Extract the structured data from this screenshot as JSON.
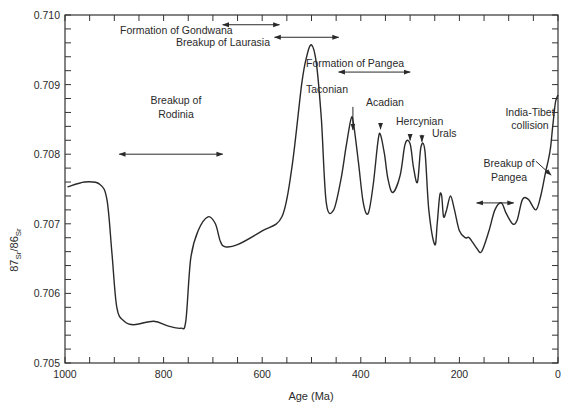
{
  "chart_data": {
    "type": "line",
    "title": "",
    "xlabel": "Age (Ma)",
    "ylabel_parts": {
      "sup1": "87",
      "sub1": "Sr",
      "slash": "/",
      "sup2": "86",
      "sub2": "Sr"
    },
    "xlim": [
      1000,
      0
    ],
    "ylim": [
      0.705,
      0.71
    ],
    "x_ticks": [
      1000,
      800,
      600,
      400,
      200,
      0
    ],
    "x_tick_labels": [
      "1000",
      "800",
      "600",
      "400",
      "200",
      "0"
    ],
    "x_minor_step": 50,
    "y_ticks": [
      0.705,
      0.706,
      0.707,
      0.708,
      0.709,
      0.71
    ],
    "y_tick_labels": [
      "0.705",
      "0.706",
      "0.707",
      "0.708",
      "0.709",
      "0.710"
    ],
    "y_minor_step": 0.0002,
    "grid": false,
    "series": [
      {
        "name": "87Sr/86Sr seawater curve",
        "x": [
          995,
          960,
          930,
          915,
          905,
          895,
          880,
          860,
          820,
          790,
          765,
          755,
          745,
          730,
          710,
          695,
          685,
          675,
          650,
          600,
          560,
          540,
          520,
          510,
          500,
          490,
          480,
          470,
          455,
          440,
          430,
          420,
          415,
          405,
          395,
          385,
          375,
          365,
          360,
          352,
          345,
          335,
          320,
          310,
          300,
          293,
          285,
          278,
          270,
          262,
          250,
          245,
          240,
          236,
          232,
          226,
          218,
          210,
          200,
          188,
          180,
          165,
          155,
          140,
          128,
          115,
          105,
          92,
          83,
          72,
          60,
          45,
          35,
          25,
          20,
          15,
          10,
          5,
          0
        ],
        "y": [
          0.70753,
          0.7076,
          0.70757,
          0.70735,
          0.7066,
          0.7058,
          0.7056,
          0.70555,
          0.7056,
          0.70553,
          0.7055,
          0.7056,
          0.7065,
          0.7069,
          0.7071,
          0.707,
          0.70675,
          0.70667,
          0.7067,
          0.7069,
          0.7071,
          0.7078,
          0.709,
          0.7094,
          0.70957,
          0.7093,
          0.7085,
          0.7073,
          0.7072,
          0.70765,
          0.7081,
          0.7085,
          0.70845,
          0.7079,
          0.7073,
          0.70715,
          0.70755,
          0.7082,
          0.70828,
          0.708,
          0.70765,
          0.70745,
          0.7077,
          0.70815,
          0.70815,
          0.7078,
          0.7076,
          0.7081,
          0.70805,
          0.7072,
          0.7067,
          0.707,
          0.7074,
          0.7074,
          0.7071,
          0.7072,
          0.7074,
          0.7072,
          0.7069,
          0.7068,
          0.7068,
          0.70665,
          0.7066,
          0.7069,
          0.7072,
          0.7073,
          0.70715,
          0.707,
          0.70705,
          0.70735,
          0.70735,
          0.7072,
          0.7074,
          0.70775,
          0.7079,
          0.7081,
          0.70845,
          0.70875,
          0.70885
        ]
      }
    ],
    "annotations": [
      {
        "label": "Formation of Gondwana",
        "type": "range",
        "x_from": 680,
        "x_to": 565,
        "y": 0.70986,
        "text_x": 880,
        "text_y": 0.7099
      },
      {
        "label": "Breakup of Laurasia",
        "type": "range",
        "x_from": 575,
        "x_to": 445,
        "y": 0.70968,
        "text_x": 735,
        "text_y": 0.70972
      },
      {
        "label": "Formation of Pangea",
        "type": "range",
        "x_from": 445,
        "x_to": 300,
        "y": 0.70918,
        "text_x": 445,
        "text_y": 0.70935
      },
      {
        "label": "Taconian",
        "type": "arrow",
        "x_arrow": 416,
        "y_from": 0.70835,
        "y_to": 0.70868,
        "text_x": 445,
        "text_y": 0.7088
      },
      {
        "label": "Acadian",
        "type": "arrow",
        "x_arrow": 360,
        "y_from": 0.70836,
        "y_to": 0.70845,
        "text_x": 380,
        "text_y": 0.70858
      },
      {
        "label": "Hercynian",
        "type": "arrow",
        "x_arrow": 300,
        "y_from": 0.7082,
        "y_to": 0.70828,
        "text_x": 318,
        "text_y": 0.70835
      },
      {
        "label": "Urals",
        "type": "arrow",
        "x_arrow": 276,
        "y_from": 0.70818,
        "y_to": 0.70828,
        "text_x": 260,
        "text_y": 0.70818
      },
      {
        "label": "Breakup of Rodinia",
        "type": "range",
        "x_from": 890,
        "x_to": 680,
        "y": 0.708,
        "text_x": 790,
        "text_y": 0.70852,
        "lines": [
          "Breakup of",
          "Rodinia"
        ]
      },
      {
        "label": "Breakup of Pangea",
        "type": "range",
        "x_from": 165,
        "x_to": 90,
        "y": 0.7073,
        "text_x": 128,
        "text_y": 0.70752,
        "lines": [
          "Breakup of",
          "Pangea"
        ]
      },
      {
        "label": "India-Tibet collision",
        "type": "arrow",
        "x_from": 45,
        "y_from": 0.7079,
        "x_to": 14,
        "y_to": 0.7077,
        "text_x": 45,
        "text_y": 0.7082,
        "lines": [
          "India-Tibet",
          "collision"
        ]
      }
    ]
  },
  "labels": {
    "annotation_gondwana": "Formation of Gondwana",
    "annotation_laurasia": "Breakup of Laurasia",
    "annotation_pangea_formation": "Formation of Pangea",
    "annotation_taconian": "Taconian",
    "annotation_acadian": "Acadian",
    "annotation_hercynian": "Hercynian",
    "annotation_urals": "Urals",
    "annotation_rodinia_1": "Breakup of",
    "annotation_rodinia_2": "Rodinia",
    "annotation_pangea_breakup_1": "Breakup of",
    "annotation_pangea_breakup_2": "Pangea",
    "annotation_india_1": "India-Tibet",
    "annotation_india_2": "collision"
  },
  "colors": {
    "line": "#2a2a2a",
    "axis": "#333333",
    "text": "#2a2a2a",
    "background": "#ffffff"
  }
}
